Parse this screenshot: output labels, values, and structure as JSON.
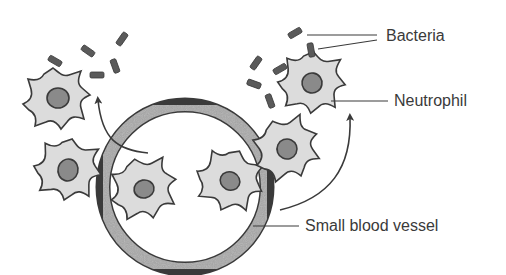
{
  "diagram": {
    "labels": {
      "bacteria": "Bacteria",
      "neutrophil": "Neutrophil",
      "vessel": "Small blood vessel"
    },
    "colors": {
      "background": "#ffffff",
      "outline": "#3a3a3a",
      "cell_fill": "#dcdcdc",
      "nucleus_fill": "#8a8a8a",
      "vessel_wall": "#a8a8a8",
      "bacteria_fill": "#5a5a5a",
      "label_text": "#3a3a3a"
    },
    "elements": {
      "vessel": {
        "cx": 185,
        "cy": 187,
        "r": 82,
        "wall_width": 13
      },
      "neutrophils": [
        {
          "id": "left-top",
          "cx": 57,
          "cy": 99
        },
        {
          "id": "left-lower",
          "cx": 68,
          "cy": 170
        },
        {
          "id": "inside-left",
          "cx": 144,
          "cy": 189
        },
        {
          "id": "inside-right",
          "cx": 230,
          "cy": 181
        },
        {
          "id": "right-lower",
          "cx": 287,
          "cy": 149
        },
        {
          "id": "right-top",
          "cx": 312,
          "cy": 83
        }
      ],
      "arrows": [
        {
          "id": "left-arrow",
          "direction": "up-left"
        },
        {
          "id": "right-arrow",
          "direction": "up-right"
        }
      ]
    }
  }
}
